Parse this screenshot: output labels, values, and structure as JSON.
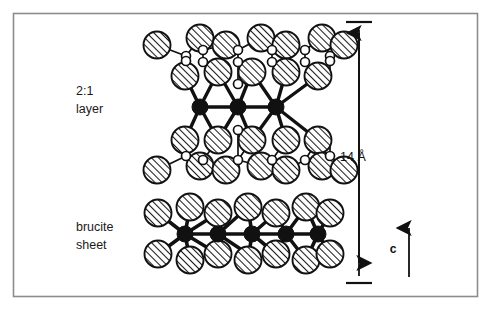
{
  "figure": {
    "kind": "crystal-structure-diagram",
    "background_color": "#ffffff",
    "border_color": "#8c8c8c",
    "ink_color": "#111111"
  },
  "labels": {
    "layer_line1": "2:1",
    "layer_line2": "layer",
    "brucite_line1": "brucite",
    "brucite_line2": "sheet",
    "dimension": "14 Å",
    "axis": "c"
  },
  "dimension_marker": {
    "value": "14 Å",
    "has_top_tick": true,
    "has_bottom_tick": true,
    "arrowheads": "both",
    "orientation": "vertical"
  },
  "axis_marker": {
    "name": "c",
    "direction": "up"
  },
  "atoms": {
    "legend": [
      {
        "key": "oxygen_hydroxyl",
        "style": "large-hatched-circle",
        "fill": "#ffffff",
        "hatch_color": "#1a1a1a"
      },
      {
        "key": "silicon",
        "style": "small-white-circle",
        "fill": "#ffffff",
        "stroke": "#111111"
      },
      {
        "key": "octahedral_cation",
        "style": "filled-black-circle",
        "fill": "#111111"
      }
    ]
  },
  "chart_data": {
    "type": "scatter",
    "title": "",
    "xlabel": "",
    "ylabel": "",
    "grid": false,
    "legend_position": "none",
    "xlim": [
      0,
      494
    ],
    "ylim": [
      0,
      324
    ],
    "series": [
      {
        "name": "oxygen_hydroxyl_large",
        "marker": "hatched-circle",
        "r": 13.5,
        "points": [
          [
            157,
            45
          ],
          [
            200,
            38
          ],
          [
            226,
            45
          ],
          [
            261,
            38
          ],
          [
            286,
            45
          ],
          [
            322,
            38
          ],
          [
            344,
            45
          ],
          [
            185,
            76
          ],
          [
            218,
            72
          ],
          [
            252,
            72
          ],
          [
            286,
            72
          ],
          [
            318,
            76
          ],
          [
            185,
            140
          ],
          [
            218,
            140
          ],
          [
            252,
            140
          ],
          [
            286,
            140
          ],
          [
            318,
            140
          ],
          [
            157,
            170
          ],
          [
            200,
            166
          ],
          [
            226,
            170
          ],
          [
            261,
            166
          ],
          [
            286,
            170
          ],
          [
            322,
            166
          ],
          [
            344,
            170
          ],
          [
            158,
            213
          ],
          [
            190,
            207
          ],
          [
            218,
            213
          ],
          [
            248,
            207
          ],
          [
            276,
            213
          ],
          [
            306,
            207
          ],
          [
            330,
            213
          ],
          [
            158,
            254
          ],
          [
            190,
            260
          ],
          [
            218,
            254
          ],
          [
            248,
            260
          ],
          [
            276,
            254
          ],
          [
            306,
            260
          ],
          [
            330,
            254
          ]
        ]
      },
      {
        "name": "silicon_small",
        "marker": "white-circle",
        "r": 4.5,
        "points": [
          [
            186,
            56
          ],
          [
            203,
            50
          ],
          [
            238,
            50
          ],
          [
            272,
            50
          ],
          [
            305,
            50
          ],
          [
            330,
            56
          ],
          [
            186,
            61
          ],
          [
            203,
            62
          ],
          [
            238,
            62
          ],
          [
            272,
            62
          ],
          [
            305,
            62
          ],
          [
            330,
            61
          ],
          [
            186,
            156
          ],
          [
            203,
            160
          ],
          [
            238,
            160
          ],
          [
            272,
            160
          ],
          [
            305,
            160
          ],
          [
            330,
            156
          ],
          [
            238,
            84
          ],
          [
            238,
            130
          ]
        ]
      },
      {
        "name": "octahedral_cation_black",
        "marker": "filled-circle",
        "r": 8,
        "points": [
          [
            200,
            107
          ],
          [
            238,
            107
          ],
          [
            276,
            107
          ],
          [
            185,
            234
          ],
          [
            218,
            234
          ],
          [
            252,
            234
          ],
          [
            286,
            234
          ],
          [
            318,
            234
          ]
        ]
      }
    ],
    "annotations": [
      {
        "text": "2:1",
        "x": 104,
        "y": 92
      },
      {
        "text": "layer",
        "x": 104,
        "y": 110
      },
      {
        "text": "brucite",
        "x": 104,
        "y": 228
      },
      {
        "text": "sheet",
        "x": 104,
        "y": 246
      },
      {
        "text": "14 Å",
        "x": 355,
        "y": 158
      },
      {
        "text": "c",
        "x": 392,
        "y": 248
      }
    ]
  }
}
